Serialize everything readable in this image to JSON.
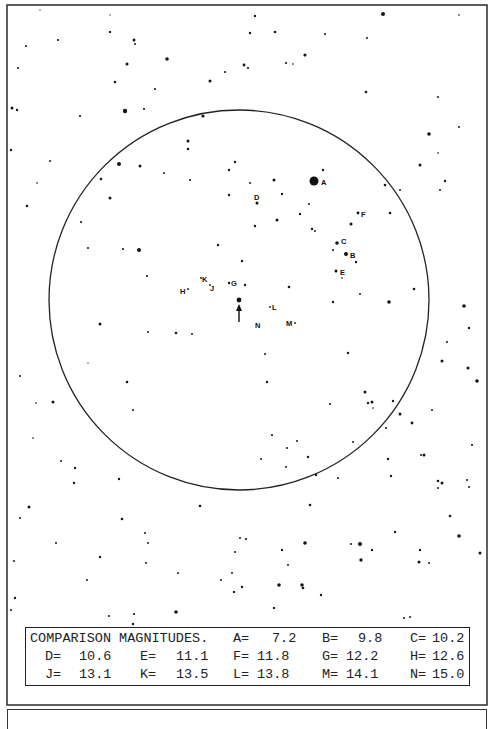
{
  "chart": {
    "frame": {
      "x": 7,
      "y": 5,
      "w": 480,
      "h": 700
    },
    "field_circle": {
      "cx": 239,
      "cy": 300,
      "r": 190
    },
    "target": {
      "x": 239,
      "y": 300,
      "marker": "arrow-up",
      "arrow": {
        "x": 239,
        "y1": 322,
        "y2": 306
      }
    },
    "comparison_stars": [
      {
        "id": "A",
        "x": 314,
        "y": 181,
        "r": 4.5,
        "lx": 321,
        "ly": 185
      },
      {
        "id": "B",
        "x": 346,
        "y": 254,
        "r": 2.0,
        "lx": 350,
        "ly": 258
      },
      {
        "id": "C",
        "x": 337,
        "y": 243,
        "r": 1.8,
        "lx": 341,
        "ly": 244
      },
      {
        "id": "D",
        "x": 257,
        "y": 203,
        "r": 1.5,
        "lx": 254,
        "ly": 200
      },
      {
        "id": "E",
        "x": 336,
        "y": 271,
        "r": 1.5,
        "lx": 340,
        "ly": 275
      },
      {
        "id": "F",
        "x": 358,
        "y": 213,
        "r": 1.4,
        "lx": 361,
        "ly": 217
      },
      {
        "id": "G",
        "x": 229,
        "y": 283,
        "r": 1.2,
        "lx": 231,
        "ly": 286
      },
      {
        "id": "H",
        "x": 188,
        "y": 289,
        "r": 0.9,
        "lx": 180,
        "ly": 294
      },
      {
        "id": "J",
        "x": 210,
        "y": 285,
        "r": 0.9,
        "lx": 210,
        "ly": 291
      },
      {
        "id": "K",
        "x": 201,
        "y": 278,
        "r": 0.9,
        "lx": 202,
        "ly": 282
      },
      {
        "id": "L",
        "x": 270,
        "y": 307,
        "r": 0.9,
        "lx": 272,
        "ly": 310
      },
      {
        "id": "M",
        "x": 295,
        "y": 323,
        "r": 0.9,
        "lx": 286,
        "ly": 326
      },
      {
        "id": "N",
        "x": 255,
        "y": 325,
        "r": 0.0,
        "lx": 255,
        "ly": 328
      }
    ],
    "field_stars": [
      [
        383,
        14,
        2
      ],
      [
        40,
        10,
        0.8
      ],
      [
        110,
        15,
        0.8
      ],
      [
        255,
        16,
        1.2
      ],
      [
        459,
        15,
        0.9
      ],
      [
        110,
        32,
        1.2
      ],
      [
        134,
        40,
        1.5
      ],
      [
        250,
        33,
        1.2
      ],
      [
        275,
        32,
        1.3
      ],
      [
        325,
        34,
        1.1
      ],
      [
        367,
        38,
        1.0
      ],
      [
        26,
        46,
        1.0
      ],
      [
        58,
        40,
        1.1
      ],
      [
        167,
        59,
        1.8
      ],
      [
        135,
        44,
        1.0
      ],
      [
        127,
        64,
        1.5
      ],
      [
        244,
        65,
        1.4
      ],
      [
        248,
        68,
        1.1
      ],
      [
        225,
        72,
        1.1
      ],
      [
        286,
        63,
        1.1
      ],
      [
        293,
        64,
        0.9
      ],
      [
        305,
        55,
        1.6
      ],
      [
        210,
        81,
        1.5
      ],
      [
        155,
        89,
        1.1
      ],
      [
        115,
        82,
        1.3
      ],
      [
        366,
        92,
        1.3
      ],
      [
        438,
        97,
        1.0
      ],
      [
        18,
        68,
        1.0
      ],
      [
        12,
        108,
        1.5
      ],
      [
        17,
        110,
        1.2
      ],
      [
        125,
        111,
        2.2
      ],
      [
        144,
        109,
        1.1
      ],
      [
        80,
        116,
        1.1
      ],
      [
        203,
        116,
        1.6
      ],
      [
        188,
        141,
        1.5
      ],
      [
        188,
        149,
        1.3
      ],
      [
        235,
        162,
        1.2
      ],
      [
        229,
        170,
        1.2
      ],
      [
        164,
        173,
        1.0
      ],
      [
        11,
        150,
        1.2
      ],
      [
        50,
        161,
        1.0
      ],
      [
        119,
        164,
        2.0
      ],
      [
        140,
        166,
        1.5
      ],
      [
        101,
        179,
        1.3
      ],
      [
        37,
        183,
        0.9
      ],
      [
        110,
        198,
        1.5
      ],
      [
        429,
        134,
        1.8
      ],
      [
        420,
        165,
        1.5
      ],
      [
        459,
        127,
        1.0
      ],
      [
        438,
        153,
        0.9
      ],
      [
        445,
        181,
        1.2
      ],
      [
        440,
        190,
        1.0
      ],
      [
        274,
        180,
        1.5
      ],
      [
        282,
        194,
        1.2
      ],
      [
        323,
        170,
        1.2
      ],
      [
        250,
        183,
        1.0
      ],
      [
        309,
        204,
        1.0
      ],
      [
        277,
        220,
        1.5
      ],
      [
        300,
        214,
        1.2
      ],
      [
        351,
        224,
        1.5
      ],
      [
        333,
        250,
        1.1
      ],
      [
        356,
        262,
        1.2
      ],
      [
        342,
        278,
        0.9
      ],
      [
        385,
        185,
        1.3
      ],
      [
        400,
        190,
        1.0
      ],
      [
        390,
        213,
        1.3
      ],
      [
        255,
        226,
        1.2
      ],
      [
        218,
        245,
        1.2
      ],
      [
        242,
        261,
        1.2
      ],
      [
        27,
        206,
        1.3
      ],
      [
        139,
        250,
        2.0
      ],
      [
        123,
        249,
        1.1
      ],
      [
        147,
        276,
        1.1
      ],
      [
        81,
        222,
        1.1
      ],
      [
        88,
        248,
        1.0
      ],
      [
        190,
        180,
        1.1
      ],
      [
        229,
        195,
        1.2
      ],
      [
        245,
        285,
        1.2
      ],
      [
        289,
        287,
        1.3
      ],
      [
        312,
        229,
        1.2
      ],
      [
        315,
        231,
        1.0
      ],
      [
        333,
        302,
        1.2
      ],
      [
        360,
        294,
        1.0
      ],
      [
        389,
        302,
        1.8
      ],
      [
        414,
        289,
        1.3
      ],
      [
        464,
        306,
        1.8
      ],
      [
        469,
        328,
        1.2
      ],
      [
        447,
        342,
        1.0
      ],
      [
        442,
        361,
        1.5
      ],
      [
        468,
        368,
        1.5
      ],
      [
        477,
        381,
        1.8
      ],
      [
        100,
        324,
        1.5
      ],
      [
        148,
        332,
        1.0
      ],
      [
        176,
        333,
        1.3
      ],
      [
        192,
        334,
        1.0
      ],
      [
        88,
        363,
        0.8
      ],
      [
        127,
        382,
        1.3
      ],
      [
        133,
        410,
        1.0
      ],
      [
        20,
        376,
        1.0
      ],
      [
        53,
        402,
        1.5
      ],
      [
        36,
        403,
        0.9
      ],
      [
        33,
        438,
        0.9
      ],
      [
        61,
        461,
        1.0
      ],
      [
        75,
        468,
        1.2
      ],
      [
        119,
        479,
        1.2
      ],
      [
        74,
        483,
        1.2
      ],
      [
        265,
        354,
        1.0
      ],
      [
        267,
        382,
        1.2
      ],
      [
        287,
        448,
        1.0
      ],
      [
        261,
        459,
        1.0
      ],
      [
        348,
        353,
        1.2
      ],
      [
        365,
        392,
        1.5
      ],
      [
        372,
        402,
        1.5
      ],
      [
        368,
        403,
        1.2
      ],
      [
        393,
        401,
        1.2
      ],
      [
        400,
        414,
        1.5
      ],
      [
        386,
        428,
        1.0
      ],
      [
        373,
        408,
        0.9
      ],
      [
        330,
        404,
        1.0
      ],
      [
        272,
        435,
        1.1
      ],
      [
        297,
        441,
        1.0
      ],
      [
        308,
        457,
        1.2
      ],
      [
        286,
        467,
        1.0
      ],
      [
        316,
        475,
        1.2
      ],
      [
        338,
        478,
        1.0
      ],
      [
        353,
        442,
        1.0
      ],
      [
        388,
        459,
        1.2
      ],
      [
        391,
        476,
        1.2
      ],
      [
        412,
        423,
        1.4
      ],
      [
        424,
        455,
        1.5
      ],
      [
        438,
        481,
        1.3
      ],
      [
        442,
        483,
        1.5
      ],
      [
        472,
        445,
        1.1
      ],
      [
        469,
        487,
        1.0
      ],
      [
        467,
        480,
        1.0
      ],
      [
        438,
        488,
        1.0
      ],
      [
        432,
        410,
        1.0
      ],
      [
        421,
        455,
        1.0
      ],
      [
        29,
        507,
        1.5
      ],
      [
        20,
        518,
        1.0
      ],
      [
        122,
        519,
        1.3
      ],
      [
        200,
        506,
        1.3
      ],
      [
        310,
        505,
        1.3
      ],
      [
        450,
        516,
        1.3
      ],
      [
        148,
        543,
        1.0
      ],
      [
        145,
        533,
        1.0
      ],
      [
        235,
        552,
        1.0
      ],
      [
        246,
        539,
        1.1
      ],
      [
        395,
        532,
        1.2
      ],
      [
        360,
        544,
        2.0
      ],
      [
        351,
        544,
        1.0
      ],
      [
        372,
        550,
        1.2
      ],
      [
        361,
        560,
        1.7
      ],
      [
        459,
        536,
        1.8
      ],
      [
        420,
        550,
        1.2
      ],
      [
        429,
        563,
        1.0
      ],
      [
        419,
        562,
        1.5
      ],
      [
        480,
        553,
        1.5
      ],
      [
        305,
        543,
        1.8
      ],
      [
        282,
        550,
        1.2
      ],
      [
        288,
        565,
        1.0
      ],
      [
        240,
        538,
        1.0
      ],
      [
        100,
        557,
        1.2
      ],
      [
        87,
        580,
        1.0
      ],
      [
        178,
        573,
        1.0
      ],
      [
        146,
        563,
        1.0
      ],
      [
        232,
        573,
        1.0
      ],
      [
        234,
        592,
        1.2
      ],
      [
        242,
        587,
        1.2
      ],
      [
        221,
        580,
        1.0
      ],
      [
        279,
        585,
        1.8
      ],
      [
        302,
        585,
        1.8
      ],
      [
        303,
        588,
        1.3
      ],
      [
        321,
        595,
        1.2
      ],
      [
        274,
        608,
        1.2
      ],
      [
        176,
        612,
        1.8
      ],
      [
        134,
        614,
        1.1
      ],
      [
        404,
        618,
        1.0
      ],
      [
        410,
        617,
        1.0
      ],
      [
        15,
        598,
        1.2
      ],
      [
        11,
        610,
        1.0
      ],
      [
        109,
        616,
        1.0
      ],
      [
        133,
        624,
        1.2
      ],
      [
        56,
        543,
        1.0
      ],
      [
        14,
        561,
        1.0
      ]
    ]
  },
  "legend": {
    "title": "COMPARISON MAGNITUDES.",
    "rows": [
      [
        {
          "label": "A=",
          "value": "7.2"
        },
        {
          "label": "B=",
          "value": "9.8"
        },
        {
          "label": "C=",
          "value": "10.2"
        }
      ],
      [
        {
          "label": "D=",
          "value": "10.6"
        },
        {
          "label": "E=",
          "value": "11.1"
        },
        {
          "label": "F=",
          "value": "11.8"
        },
        {
          "label": "G=",
          "value": "12.2"
        },
        {
          "label": "H=",
          "value": "12.6"
        }
      ],
      [
        {
          "label": "J=",
          "value": "13.1"
        },
        {
          "label": "K=",
          "value": "13.5"
        },
        {
          "label": "L=",
          "value": "13.8"
        },
        {
          "label": "M=",
          "value": "14.1"
        },
        {
          "label": "N=",
          "value": "15.0"
        }
      ]
    ]
  }
}
